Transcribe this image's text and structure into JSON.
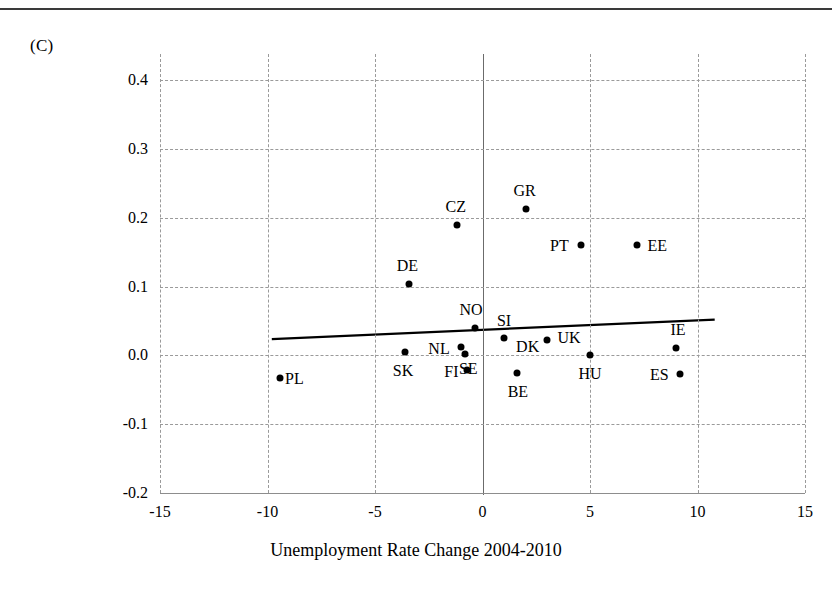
{
  "figure": {
    "panel_label": "(C)",
    "xlabel": "Unemployment Rate Change 2004-2010",
    "ylabel": "Net change in Work-Family Conflict"
  },
  "chart_data": {
    "type": "scatter",
    "title": "",
    "panel": "(C)",
    "xlabel": "Unemployment Rate Change 2004-2010",
    "ylabel": "Net change in Work-Family Conflict",
    "xlim": [
      -15,
      15
    ],
    "ylim": [
      -0.2,
      0.4
    ],
    "xticks": [
      "-15",
      "-10",
      "-5",
      "0",
      "5",
      "10",
      "15"
    ],
    "xtick_values": [
      -15,
      -10,
      -5,
      0,
      5,
      10,
      15
    ],
    "yticks": [
      "0.4",
      "0.3",
      "0.2",
      "0.1",
      "0.0",
      "-0.1",
      "-0.2"
    ],
    "ytick_values": [
      0.4,
      0.3,
      0.2,
      0.1,
      0.0,
      -0.1,
      -0.2
    ],
    "grid": "dashed-both-axes",
    "legend": "none",
    "points": [
      {
        "label": "PL",
        "x": -9.4,
        "y": -0.033,
        "label_dx": 14,
        "label_dy": 1
      },
      {
        "label": "SK",
        "x": -3.6,
        "y": 0.005,
        "label_dx": -2,
        "label_dy": 19
      },
      {
        "label": "DE",
        "x": -3.4,
        "y": 0.103,
        "label_dx": -2,
        "label_dy": -18
      },
      {
        "label": "CZ",
        "x": -1.2,
        "y": 0.19,
        "label_dx": -1,
        "label_dy": -18
      },
      {
        "label": "NL",
        "x": -1.0,
        "y": 0.012,
        "label_dx": -22,
        "label_dy": 2
      },
      {
        "label": "SE",
        "x": -0.8,
        "y": 0.002,
        "label_dx": 3,
        "label_dy": 15
      },
      {
        "label": "FI",
        "x": -0.7,
        "y": -0.022,
        "label_dx": -16,
        "label_dy": 2
      },
      {
        "label": "NO",
        "x": -0.35,
        "y": 0.04,
        "label_dx": -4,
        "label_dy": -18
      },
      {
        "label": "SI",
        "x": 1.0,
        "y": 0.025,
        "label_dx": 0,
        "label_dy": -17
      },
      {
        "label": "BE",
        "x": 1.6,
        "y": -0.025,
        "label_dx": 1,
        "label_dy": 19
      },
      {
        "label": "GR",
        "x": 2.0,
        "y": 0.213,
        "label_dx": -1,
        "label_dy": -18
      },
      {
        "label": "UK",
        "x": 3.0,
        "y": 0.022,
        "label_dx": 22,
        "label_dy": -2
      },
      {
        "label": "PT",
        "x": 4.6,
        "y": 0.16,
        "label_dx": -22,
        "label_dy": 1
      },
      {
        "label": "HU",
        "x": 5.0,
        "y": 0.0,
        "label_dx": 0,
        "label_dy": 19
      },
      {
        "label": "EE",
        "x": 7.2,
        "y": 0.16,
        "label_dx": 20,
        "label_dy": 1
      },
      {
        "label": "IE",
        "x": 9.0,
        "y": 0.01,
        "label_dx": 2,
        "label_dy": -18
      },
      {
        "label": "ES",
        "x": 9.2,
        "y": -0.027,
        "label_dx": -21,
        "label_dy": 1
      }
    ],
    "trendline": {
      "x_start": -9.8,
      "y_start": 0.0235,
      "x_end": 10.8,
      "y_end": 0.052,
      "style": "solid",
      "color": "#000000"
    },
    "dk_label": {
      "label": "DK",
      "x": 2.1,
      "y": 0.012
    }
  }
}
